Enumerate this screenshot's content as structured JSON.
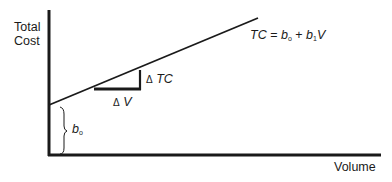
{
  "diagram": {
    "y_axis_label_line1": "Total",
    "y_axis_label_line2": "Cost",
    "x_axis_label": "Volume",
    "equation": {
      "lhs": "TC",
      "eq": "=",
      "b0": "b",
      "b0_sub": "o",
      "plus": "+",
      "b1": "b",
      "b1_sub": "1",
      "var": "V"
    },
    "delta_tc_label": {
      "delta": "Δ",
      "text": "TC"
    },
    "delta_v_label": {
      "delta": "Δ",
      "text": "V"
    },
    "intercept_label": {
      "text": "b",
      "sub": "o"
    },
    "line_color": "#1a1a1a"
  }
}
